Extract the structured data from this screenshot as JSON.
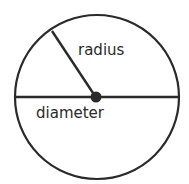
{
  "diagram": {
    "labels": {
      "radius": "radius",
      "diameter": "diameter"
    },
    "colors": {
      "stroke": "#2a2a2a",
      "background": "#ffffff"
    }
  }
}
